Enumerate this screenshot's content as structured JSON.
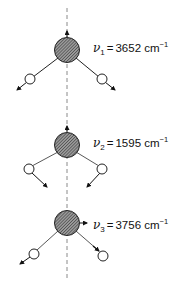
{
  "figure": {
    "symmetry_axis": "dashed vertical line",
    "colors": {
      "line": "#222222",
      "oxygen_fill": "#7a7a7a",
      "hydrogen_fill": "#ffffff",
      "axis": "#888888"
    }
  },
  "modes": [
    {
      "symbol": "ν",
      "index": "1",
      "equals": "=",
      "value": "3652",
      "unit": "cm",
      "exponent": "−1",
      "oxygen_arrow": "up",
      "hydrogen_arrows": "outward along bonds"
    },
    {
      "symbol": "ν",
      "index": "2",
      "equals": "=",
      "value": "1595",
      "unit": "cm",
      "exponent": "−1",
      "oxygen_arrow": "up",
      "hydrogen_arrows": "inward, downward"
    },
    {
      "symbol": "ν",
      "index": "3",
      "equals": "=",
      "value": "3756",
      "unit": "cm",
      "exponent": "−1",
      "oxygen_arrow": "right",
      "hydrogen_arrows": "left H outward, right H inward"
    }
  ]
}
